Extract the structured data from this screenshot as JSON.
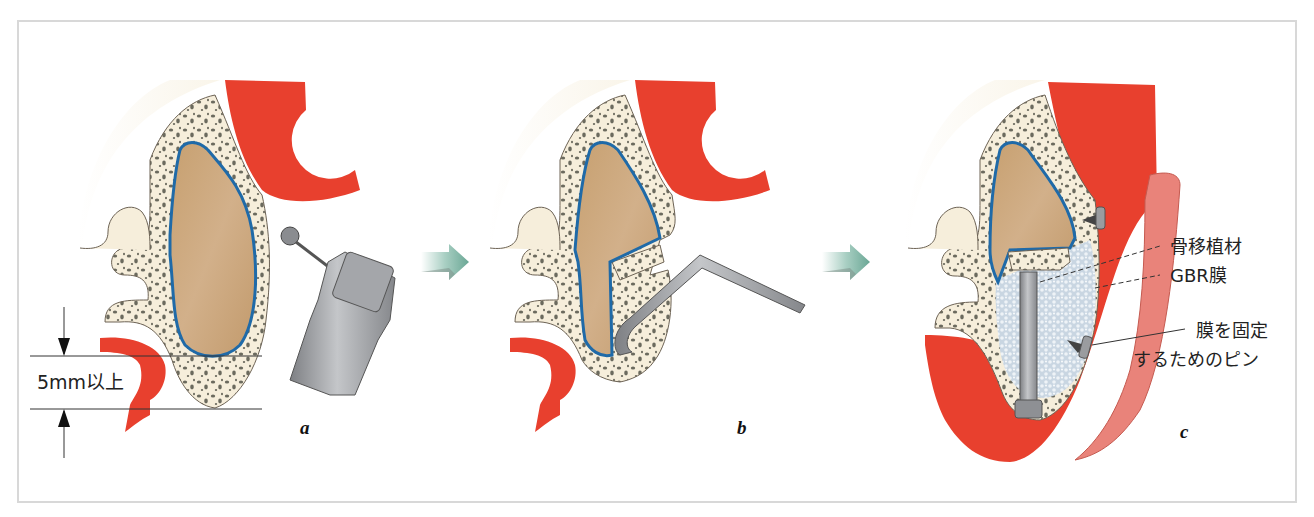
{
  "figure": {
    "panels": [
      {
        "id": "a",
        "label": "a",
        "step": "Lateral bone window opened with round bur on handpiece"
      },
      {
        "id": "b",
        "label": "b",
        "step": "Bone lid rotated inward and sinus membrane elevated with curette"
      },
      {
        "id": "c",
        "label": "c",
        "step": "Implant placed, space filled with graft, covered by GBR membrane fixed with pins"
      }
    ],
    "measurement": {
      "label": "5mm以上"
    },
    "annotations": [
      {
        "id": "bone-graft",
        "label": "骨移植材"
      },
      {
        "id": "gbr-membrane",
        "label": "GBR膜"
      },
      {
        "id": "membrane-pin",
        "label_line1": "膜を固定",
        "label_line2": "するためのピン"
      }
    ],
    "icons": {
      "step_arrow": "right-arrow-icon"
    },
    "colors": {
      "gingiva": "#e8402e",
      "bone": "#f6eedb",
      "bone_pores": "#6b6a5e",
      "sinus": "#c9a47a",
      "schneiderian_membrane": "#1f6aa8",
      "graft": "#dde6ee",
      "metal": "#9a9c9f",
      "arrow": "#7fb5a5",
      "frame": "#d8d8d8"
    }
  }
}
